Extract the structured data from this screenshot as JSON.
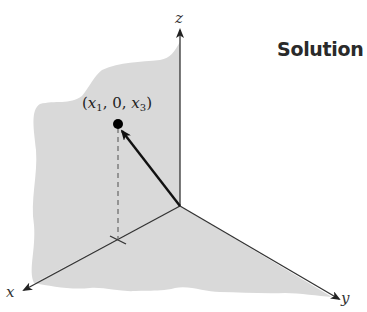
{
  "heading": {
    "label": "Solution"
  },
  "axes": {
    "x": {
      "label": "x"
    },
    "y": {
      "label": "y"
    },
    "z": {
      "label": "z"
    }
  },
  "point": {
    "label_open": "(",
    "x1": "x",
    "x1_sub": "1",
    "sep1": ", 0, ",
    "x3": "x",
    "x3_sub": "3",
    "label_close": ")"
  },
  "colors": {
    "plane_fill": "#d9d9d9",
    "axis_stroke": "#333333",
    "vector_stroke": "#111111",
    "dashed_stroke": "#777777"
  }
}
